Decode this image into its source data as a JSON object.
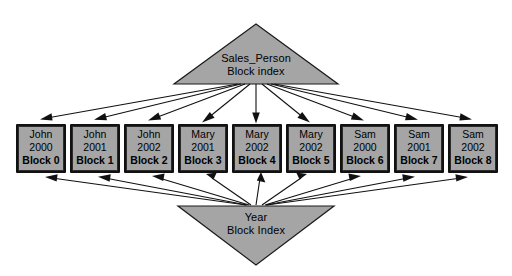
{
  "diagram": {
    "title_top": "Sales_Person Block index",
    "title_bottom": "Year Block Index",
    "colors": {
      "shape_fill": "#a5a5a5",
      "outline": "#111111",
      "background": "#ffffff",
      "text": "#000000"
    },
    "top_index": {
      "line1": "Sales_Person",
      "line2": "Block index"
    },
    "bottom_index": {
      "line1": "Year",
      "line2": "Block Index"
    },
    "blocks": [
      {
        "name": "John",
        "year": "2000",
        "id": "Block 0"
      },
      {
        "name": "John",
        "year": "2001",
        "id": "Block 1"
      },
      {
        "name": "John",
        "year": "2002",
        "id": "Block 2"
      },
      {
        "name": "Mary",
        "year": "2001",
        "id": "Block 3"
      },
      {
        "name": "Mary",
        "year": "2002",
        "id": "Block 4"
      },
      {
        "name": "Mary",
        "year": "2002",
        "id": "Block 5"
      },
      {
        "name": "Sam",
        "year": "2000",
        "id": "Block 6"
      },
      {
        "name": "Sam",
        "year": "2001",
        "id": "Block 7"
      },
      {
        "name": "Sam",
        "year": "2002",
        "id": "Block 8"
      }
    ]
  }
}
